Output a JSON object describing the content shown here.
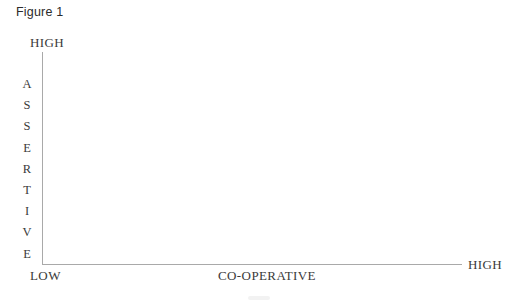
{
  "figure": {
    "caption": "Figure 1"
  },
  "chart_data": {
    "type": "scatter",
    "title": "Figure 1",
    "xlabel": "CO-OPERATIVE",
    "ylabel": "ASSERTIVE",
    "x_tick_labels": [
      "LOW",
      "HIGH"
    ],
    "y_tick_labels": [
      "HIGH"
    ],
    "series": [],
    "x": [],
    "values": [],
    "annotations": [],
    "grid": false,
    "legend": "none",
    "note": "Empty two-axis conceptual grid; no data points plotted"
  },
  "axes": {
    "y": {
      "name": "ASSERTIVE",
      "letters": [
        "A",
        "S",
        "S",
        "E",
        "R",
        "T",
        "I",
        "V",
        "E"
      ],
      "high_label": "HIGH"
    },
    "x": {
      "name": "CO-OPERATIVE",
      "low_label": "LOW",
      "high_label": "HIGH"
    }
  },
  "colors": {
    "background": "#ffffff",
    "axis_line": "#a9a9a9",
    "serif_text": "#3a3a3a",
    "caption_text": "#2b2b2b"
  }
}
